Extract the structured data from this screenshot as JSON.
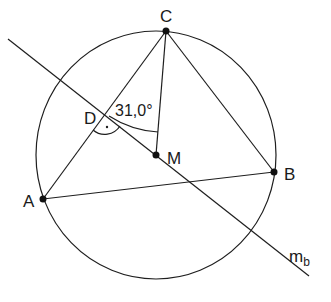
{
  "diagram": {
    "type": "geometry-construction",
    "points": {
      "A": {
        "label": "A"
      },
      "B": {
        "label": "B"
      },
      "C": {
        "label": "C"
      },
      "D": {
        "label": "D"
      },
      "M": {
        "label": "M"
      }
    },
    "line_label": {
      "main": "m",
      "sub": "b"
    },
    "angle_label": "31,0°",
    "right_angle_marker": "·"
  }
}
